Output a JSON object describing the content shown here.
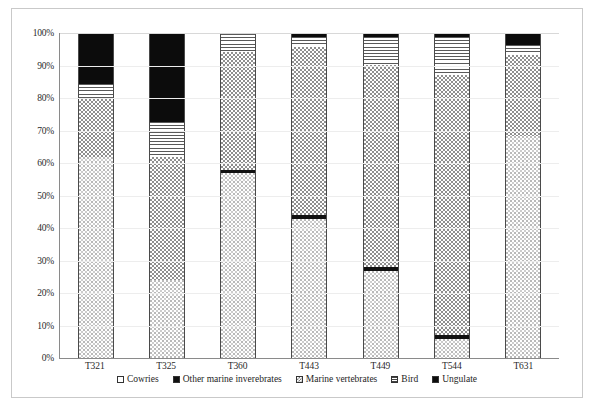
{
  "chart_data": {
    "type": "bar",
    "subtype": "stacked-100-percent",
    "title": "",
    "xlabel": "",
    "ylabel": "",
    "ylim": [
      0,
      100
    ],
    "ytick_labels": [
      "100%",
      "90%",
      "80%",
      "70%",
      "60%",
      "50%",
      "40%",
      "30%",
      "20%",
      "10%",
      "0%"
    ],
    "ytick_values": [
      100,
      90,
      80,
      70,
      60,
      50,
      40,
      30,
      20,
      10,
      0
    ],
    "grid": true,
    "legend_position": "bottom",
    "categories": [
      "T321",
      "T325",
      "T360",
      "T443",
      "T449",
      "T544",
      "T631"
    ],
    "series": [
      {
        "name": "Cowries",
        "pattern": "white-fine-dots",
        "values": [
          62.0,
          24.0,
          57.0,
          43.0,
          27.0,
          6.0,
          68.5
        ]
      },
      {
        "name": "Other marine inverebrates",
        "pattern": "solid-black",
        "values": [
          0.0,
          0.0,
          1.0,
          1.0,
          1.0,
          1.0,
          0.0
        ]
      },
      {
        "name": "Marine vertebrates",
        "pattern": "dense-checkerboard",
        "values": [
          18.0,
          38.0,
          36.5,
          52.0,
          62.5,
          80.5,
          25.0
        ]
      },
      {
        "name": "Bird",
        "pattern": "horizontal-lines",
        "values": [
          4.5,
          11.0,
          5.5,
          3.0,
          8.5,
          11.5,
          3.0
        ]
      },
      {
        "name": "Ungulate",
        "pattern": "solid-black",
        "values": [
          15.5,
          27.0,
          0.0,
          1.0,
          1.0,
          1.0,
          3.5
        ]
      }
    ],
    "stack_order_bottom_to_top": [
      "Cowries",
      "Other marine inverebrates",
      "Marine vertebrates",
      "Bird",
      "Ungulate"
    ]
  },
  "legend": {
    "items": [
      {
        "label": "Cowries",
        "swatch": "cowries-swatch-icon"
      },
      {
        "label": "Other marine inverebrates",
        "swatch": "other-marine-inverebrates-swatch-icon"
      },
      {
        "label": "Marine vertebrates",
        "swatch": "marine-vertebrates-swatch-icon"
      },
      {
        "label": "Bird",
        "swatch": "bird-swatch-icon"
      },
      {
        "label": "Ungulate",
        "swatch": "ungulate-swatch-icon"
      }
    ]
  },
  "colors": {
    "frame": "#c9c9c9",
    "axis": "#8a8a8a",
    "gridline": "#ededed",
    "text": "#222222",
    "bar_outline": "#4a4a4a",
    "solid_black": "#111111",
    "checker_grey": "#8f8f8f",
    "background": "#ffffff"
  }
}
